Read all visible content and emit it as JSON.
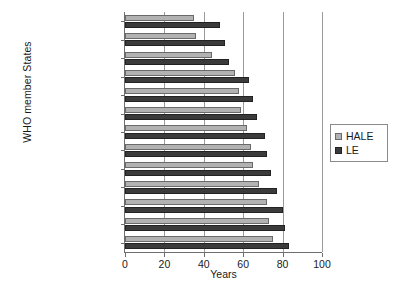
{
  "chart_data": {
    "type": "bar",
    "orientation": "horizontal",
    "title": "",
    "xlabel": "Years",
    "ylabel": "WHO member States",
    "xlim": [
      0,
      100
    ],
    "xticks": [
      0,
      20,
      40,
      60,
      80,
      100
    ],
    "grid": true,
    "legend_position": "right",
    "categories": [
      "Sierra Leone",
      "Malawi",
      "South Africa",
      "India",
      "Russian Federation",
      "Egypt",
      "Brazil",
      "China",
      "Mexico",
      "USA",
      "Sweden",
      "Australia",
      "Japan"
    ],
    "series": [
      {
        "name": "HALE",
        "color": "#b2b2b2",
        "values": [
          35,
          36,
          44,
          56,
          58,
          59,
          62,
          64,
          65,
          68,
          72,
          73,
          75
        ]
      },
      {
        "name": "LE",
        "color": "#3b3b3b",
        "values": [
          48,
          51,
          53,
          63,
          65,
          67,
          71,
          72,
          74,
          77,
          80,
          81,
          83
        ]
      }
    ]
  },
  "legend": {
    "items": [
      {
        "label": "HALE",
        "swatch": "light-gray-square"
      },
      {
        "label": "LE",
        "swatch": "dark-square"
      }
    ]
  }
}
